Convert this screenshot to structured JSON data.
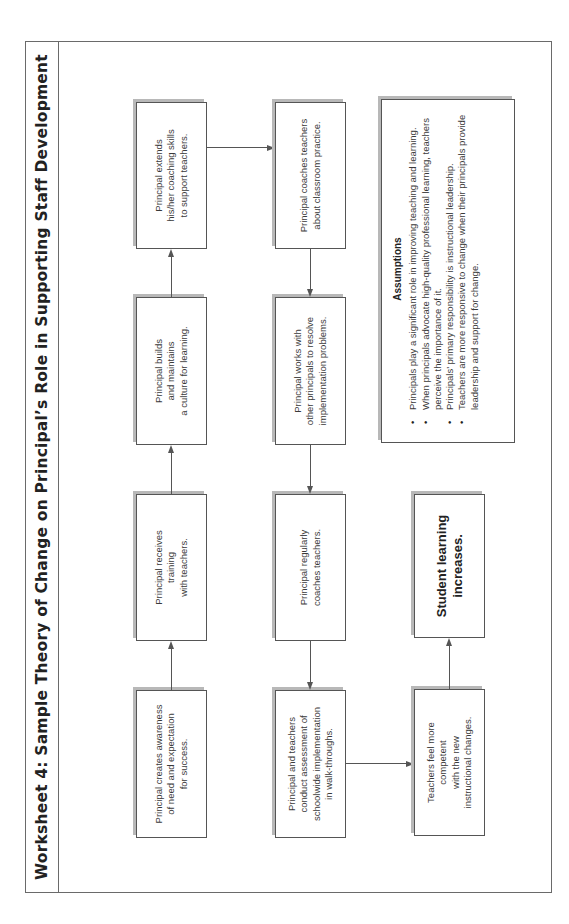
{
  "page": {
    "title": "Worksheet 4: Sample Theory of Change on Principal’s Role in Supporting Staff Development"
  },
  "diagram": {
    "row1": [
      {
        "id": "creates",
        "text": "Principal creates awareness\nof need and expectation\nfor success."
      },
      {
        "id": "receives",
        "text": "Principal receives\ntraining\nwith teachers."
      },
      {
        "id": "builds",
        "text": "Principal builds\nand maintains\na culture for learning."
      },
      {
        "id": "extends",
        "text": "Principal extends\nhis/her coaching skills\nto support teachers."
      }
    ],
    "row2": [
      {
        "id": "walkthroughs",
        "text": "Principal and teachers\nconduct assessment of\nschoolwide implementation\nin walk-throughs."
      },
      {
        "id": "regularly",
        "text": "Principal regularly\ncoaches teachers."
      },
      {
        "id": "works",
        "text": "Principal works with\nother principals to resolve\nimplementation problems."
      },
      {
        "id": "coaches",
        "text": "Principal coaches teachers\nabout classroom practice."
      }
    ],
    "row3": [
      {
        "id": "teachers_feel",
        "text": "Teachers feel more\ncompetent\nwith the new\ninstructional changes."
      },
      {
        "id": "student_learning",
        "text": "Student learning\nincreases."
      }
    ],
    "connections": [
      [
        "creates",
        "receives"
      ],
      [
        "receives",
        "builds"
      ],
      [
        "builds",
        "extends"
      ],
      [
        "extends",
        "coaches"
      ],
      [
        "coaches",
        "works"
      ],
      [
        "works",
        "regularly"
      ],
      [
        "regularly",
        "walkthroughs"
      ],
      [
        "walkthroughs",
        "teachers_feel"
      ],
      [
        "teachers_feel",
        "student_learning"
      ]
    ],
    "assumptions": {
      "heading": "Assumptions",
      "items": [
        "Principals play a significant role in improving teaching and learning.",
        "When principals advocate high-quality professional learning, teachers perceive the importance of it.",
        "Principals’ primary responsibility is instructional leadership.",
        "Teachers are more responsive to change when their principals provide leadership and support for change."
      ]
    },
    "colors": {
      "border": "#555555",
      "shadow": "#b8b8b8",
      "text": "#3a3a3a"
    }
  }
}
